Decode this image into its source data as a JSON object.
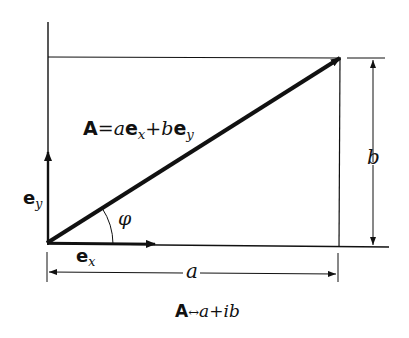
{
  "diagram": {
    "colors": {
      "line": "#111111",
      "background": "#ffffff"
    },
    "vector_equation": {
      "vec": "A",
      "eq": "=",
      "a": "a",
      "ex_base": "e",
      "ex_sub": "x",
      "plus": "+",
      "b": "b",
      "ey_base": "e",
      "ey_sub": "y"
    },
    "unit_vector_x": {
      "base": "e",
      "sub": "x"
    },
    "unit_vector_y": {
      "base": "e",
      "sub": "y"
    },
    "angle_label": "φ",
    "dimension_horizontal": "a",
    "dimension_vertical": "b",
    "correspondence": {
      "vec": "A",
      "arrow": "↔",
      "real": "a",
      "plus": "+",
      "imag": "ib"
    },
    "geometry": {
      "origin": [
        47,
        243
      ],
      "tip": [
        340,
        58
      ],
      "rect_right_x": 340,
      "rect_top_y": 57,
      "baseline_y": 245
    }
  }
}
